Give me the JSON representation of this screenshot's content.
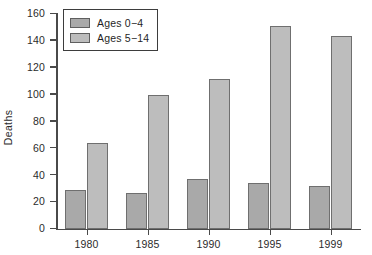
{
  "chart_data": {
    "type": "bar",
    "title": "",
    "subtitle": "",
    "xlabel": "",
    "ylabel": "Deaths",
    "categories": [
      "1980",
      "1985",
      "1990",
      "1995",
      "1999"
    ],
    "series": [
      {
        "name": "Ages 0−4",
        "color": "#a9a9a9",
        "values": [
          29,
          27,
          37,
          34,
          32
        ]
      },
      {
        "name": "Ages 5−14",
        "color": "#bdbdbd",
        "values": [
          64,
          100,
          112,
          151,
          144
        ]
      }
    ],
    "ylim": [
      0,
      160
    ],
    "ytick_values": [
      0,
      20,
      40,
      60,
      80,
      100,
      120,
      140,
      160
    ],
    "ytick_labels": [
      "0",
      "20",
      "40",
      "60",
      "80",
      "100",
      "120",
      "140",
      "160"
    ],
    "grid": false,
    "legend_position": "upper left",
    "legend_entries": [
      "Ages 0−4",
      "Ages 5−14"
    ],
    "annotations": []
  }
}
